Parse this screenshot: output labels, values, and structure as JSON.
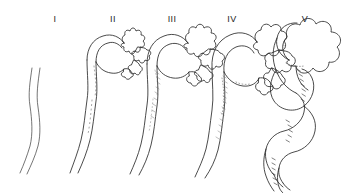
{
  "figure": {
    "background_color": "#ffffff",
    "ink_color": "#2a2a2a",
    "width": 345,
    "height": 193,
    "style": "pen-and-ink line drawing",
    "stages": [
      {
        "label": "I",
        "label_x": 55,
        "label_y": 14,
        "description": "simple unbranched straight tube, gently sigmoid, no head",
        "head": "none",
        "lobes": 0,
        "shaft": "slightly wavy vertical tube",
        "shading": "none"
      },
      {
        "label": "II",
        "label_x": 113,
        "label_y": 14,
        "description": "hooked tube with small branched head bearing pointed lobes",
        "head": "small, star-like with pointed projections",
        "lobes": 7,
        "shaft": "curved hook at top, wavy descending tube",
        "shading": "light stippling on inner curve"
      },
      {
        "label": "III",
        "label_x": 172,
        "label_y": 14,
        "description": "larger branched head with deeper clefts, thicker shaft",
        "head": "medium, deeply indented with angular lobes",
        "lobes": 10,
        "shaft": "curved hook, moderately thickened wavy tube",
        "shading": "stippled hatching along inner curve"
      },
      {
        "label": "IV",
        "label_x": 232,
        "label_y": 14,
        "description": "rounded multi-lobed head, markedly thickened shaft",
        "head": "large, rounded scalloped lobes",
        "lobes": 11,
        "shaft": "broad thickened tube with wavy descent",
        "shading": "dense stipple along inner wall"
      },
      {
        "label": "V",
        "label_x": 305,
        "label_y": 14,
        "description": "largest rounded lobed head with strongly coiled sigmoid shaft",
        "head": "very large, bulbous rounded lobes",
        "lobes": 9,
        "shaft": "thick, strongly coiled sigmoid loop",
        "shading": "heavy hatching along inner curvature"
      }
    ]
  }
}
